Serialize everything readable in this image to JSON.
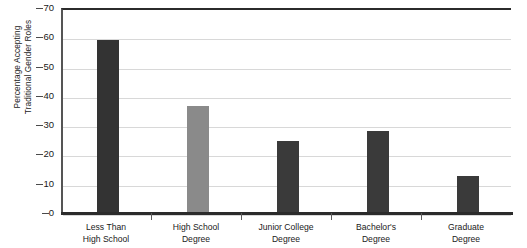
{
  "chart_data": {
    "type": "bar",
    "title": "",
    "xlabel": "",
    "ylabel_line1": "Percentage Accepting",
    "ylabel_line2": "Traditional Gender Roles",
    "categories": [
      "Less Than High School",
      "High School Degree",
      "Junior College Degree",
      "Bachelor's Degree",
      "Graduate Degree"
    ],
    "category_lines": [
      [
        "Less Than",
        "High School"
      ],
      [
        "High School",
        "Degree"
      ],
      [
        "Junior College",
        "Degree"
      ],
      [
        "Bachelor's",
        "Degree"
      ],
      [
        "Graduate",
        "Degree"
      ]
    ],
    "values": [
      59,
      36.5,
      24.7,
      28,
      12.5
    ],
    "bar_colors": [
      "#333333",
      "#8a8a8a",
      "#3a3a3a",
      "#3a3a3a",
      "#3a3a3a"
    ],
    "ylim": [
      0,
      70
    ],
    "yticks": [
      0,
      10,
      20,
      30,
      40,
      50,
      60,
      70
    ],
    "ytick_labels": [
      "0",
      "10",
      "20",
      "30",
      "40",
      "50",
      "60",
      "70"
    ],
    "grid": true,
    "legend": "none"
  },
  "colors": {
    "axis": "#2b2b2b",
    "gridline": "#d8d8d8",
    "background": "#ffffff",
    "text": "#1a1a1a"
  }
}
